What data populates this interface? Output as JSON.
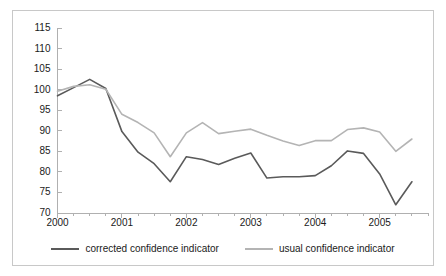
{
  "chart_data": {
    "type": "line",
    "title": "",
    "xlabel": "",
    "ylabel": "",
    "ylim": [
      70,
      115
    ],
    "ytick_step": 5,
    "ytick_labels": [
      "115",
      "110",
      "105",
      "100",
      "95",
      "90",
      "85",
      "80",
      "75",
      "70"
    ],
    "ytick_values": [
      115,
      110,
      105,
      100,
      95,
      90,
      85,
      80,
      75,
      70
    ],
    "xtick_labels": [
      "2000",
      "2001",
      "2002",
      "2003",
      "2004",
      "2005"
    ],
    "xtick_values": [
      2000,
      2001,
      2002,
      2003,
      2004,
      2005
    ],
    "xlim": [
      2000,
      2005.75
    ],
    "x_minor_tick_step": 0.25,
    "grid": false,
    "legend_position": "bottom",
    "x": [
      2000,
      2000.25,
      2000.5,
      2000.75,
      2001,
      2001.25,
      2001.5,
      2001.75,
      2002,
      2002.25,
      2002.5,
      2002.75,
      2003,
      2003.25,
      2003.5,
      2003.75,
      2004,
      2004.25,
      2004.5,
      2004.75,
      2005,
      2005.25,
      2005.5
    ],
    "series": [
      {
        "name": "corrected confidence indicator",
        "color": "#5a5a5a",
        "values": [
          98.5,
          100.5,
          102.5,
          100.3,
          89.8,
          84.8,
          82.0,
          77.6,
          83.7,
          83.0,
          81.8,
          83.3,
          84.6,
          78.5,
          78.8,
          78.8,
          79.1,
          81.5,
          85.1,
          84.5,
          79.5,
          72.0,
          77.6
        ]
      },
      {
        "name": "usual confidence indicator",
        "color": "#b4b4b4",
        "values": [
          99.6,
          100.8,
          101.2,
          100.1,
          94.0,
          92.0,
          89.5,
          83.7,
          89.5,
          92.0,
          89.3,
          89.9,
          90.4,
          88.9,
          87.5,
          86.4,
          87.6,
          87.6,
          90.3,
          90.7,
          89.7,
          85.0,
          88.0
        ]
      }
    ]
  },
  "legend": {
    "entries": [
      {
        "label": "corrected confidence indicator",
        "color": "#5a5a5a"
      },
      {
        "label": "usual confidence indicator",
        "color": "#b4b4b4"
      }
    ]
  },
  "axes": {
    "axis_color": "#b0b0b0",
    "tick_color": "#b0b0b0",
    "text_color": "#1a1a1a",
    "frame_color": "#c8c8c8",
    "background": "#ffffff"
  }
}
